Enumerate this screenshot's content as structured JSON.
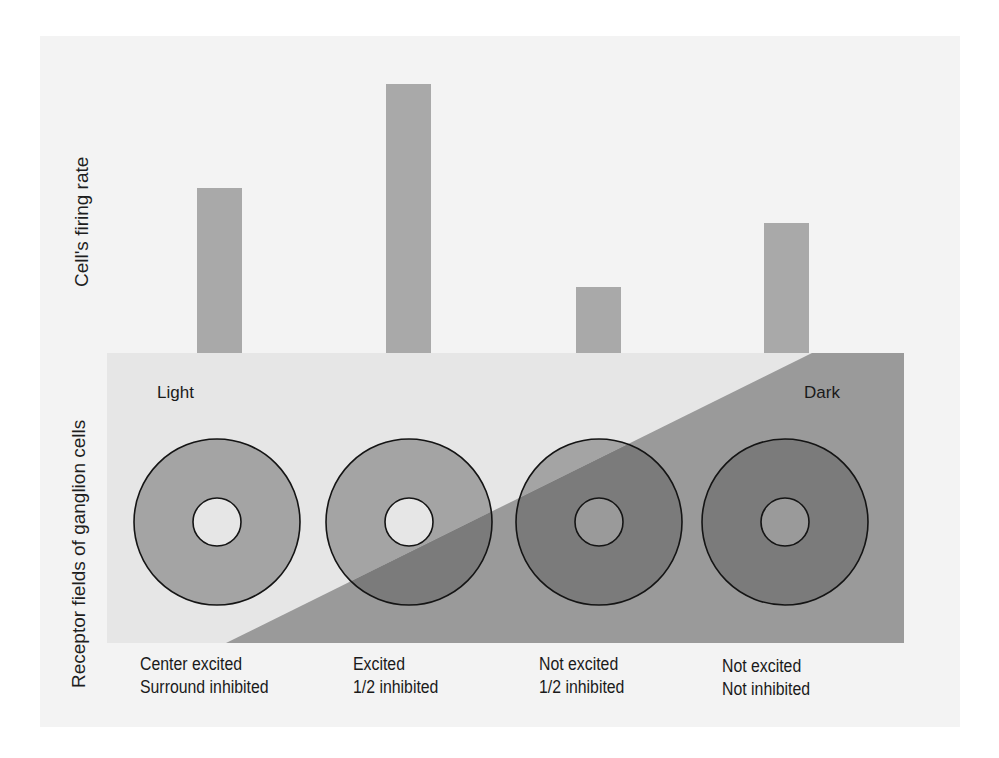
{
  "figure": {
    "background_color": "#f3f3f3",
    "bar_color": "#a9a9a9",
    "light_region_color": "#e6e6e6",
    "dark_region_color": "#9a9a9a",
    "ring_light_color": "#a4a4a4",
    "ring_dark_color": "#7b7b7b",
    "center_light_color": "#e6e6e6",
    "center_dark_color": "#9a9a9a",
    "outline_color": "#141414"
  },
  "labels": {
    "top_axis": "Cell's firing rate",
    "bottom_axis": "Receptor fields of ganglion cells",
    "light": "Light",
    "dark": "Dark"
  },
  "cells": [
    {
      "line1": "Center excited",
      "line2": "Surround inhibited"
    },
    {
      "line1": "Excited",
      "line2": "1/2 inhibited"
    },
    {
      "line1": "Not excited",
      "line2": "1/2 inhibited"
    },
    {
      "line1": "Not excited",
      "line2": "Not inhibited"
    }
  ],
  "chart_data": {
    "type": "bar",
    "title": "",
    "xlabel": "Receptor fields of ganglion cells",
    "ylabel": "Cell's firing rate",
    "categories": [
      "Center excited / Surround inhibited",
      "Excited / 1/2 inhibited",
      "Not excited / 1/2 inhibited",
      "Not excited / Not inhibited"
    ],
    "values": [
      165,
      269,
      66,
      130
    ],
    "units": "relative bar height (px, no numeric axis shown)",
    "grid": false,
    "legend": "none",
    "ylim": [
      0,
      280
    ]
  }
}
